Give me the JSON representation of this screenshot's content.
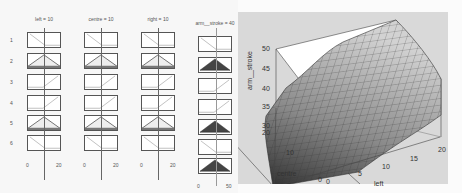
{
  "rule_viewer": {
    "inputs": [
      {
        "label": "left = 10",
        "range_min": "0",
        "range_max": "20",
        "value": 10
      },
      {
        "label": "centre = 10",
        "range_min": "0",
        "range_max": "20",
        "value": 10
      },
      {
        "label": "right = 10",
        "range_min": "0",
        "range_max": "20",
        "value": 10
      }
    ],
    "output": {
      "label": "arm__stroke = 40",
      "range_min": "0",
      "range_max": "50",
      "value": 40
    },
    "rules": [
      "1",
      "2",
      "3",
      "4",
      "5",
      "6"
    ],
    "input_mf_shapes": [
      "zmf",
      "trimf",
      "smf",
      "smf",
      "trimf",
      "zmf"
    ],
    "output_mf_shapes": [
      "zmf",
      "trimf-filled",
      "smf",
      "smf",
      "trimf-filled",
      "zmf",
      "aggregate"
    ]
  },
  "surface_viewer": {
    "zlabel": "arm__stroke",
    "xlabel": "left",
    "ylabel": "centre",
    "z_ticks": [
      "50",
      "45",
      "40",
      "35",
      "30"
    ],
    "x_ticks": [
      "0",
      "5",
      "10",
      "15",
      "20"
    ],
    "y_ticks": [
      "0",
      "10",
      "20"
    ],
    "y_tick_20": "20"
  },
  "colors": {
    "panel_bg": "#d9d9d9",
    "filled_mf": "#444444",
    "surface_light": "#cfcfcf",
    "surface_dark": "#3a3a3a"
  }
}
